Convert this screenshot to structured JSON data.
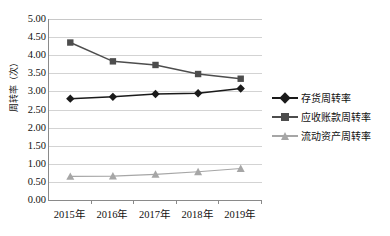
{
  "chart_data": {
    "type": "line",
    "title": "",
    "xlabel": "",
    "ylabel": "周转率（次）",
    "categories": [
      "2015年",
      "2016年",
      "2017年",
      "2018年",
      "2019年"
    ],
    "ylim": [
      0.0,
      5.0
    ],
    "ytick_step": 0.5,
    "yticks": [
      "5.00",
      "4.50",
      "4.00",
      "3.50",
      "3.00",
      "2.50",
      "2.00",
      "1.50",
      "1.00",
      "0.50",
      "0.00"
    ],
    "grid": true,
    "legend_position": "right",
    "series": [
      {
        "name": "存货周转率",
        "marker": "diamond",
        "color": "#1a1a1a",
        "values": [
          2.8,
          2.85,
          2.93,
          2.95,
          3.08
        ]
      },
      {
        "name": "应收账款周转率",
        "marker": "square",
        "color": "#4d4d4d",
        "values": [
          4.35,
          3.83,
          3.73,
          3.48,
          3.35
        ]
      },
      {
        "name": "流动资产周转率",
        "marker": "triangle",
        "color": "#a6a6a6",
        "values": [
          0.65,
          0.66,
          0.71,
          0.78,
          0.87
        ]
      }
    ]
  },
  "axis": {
    "y_title": "周转率（次）"
  },
  "legend": {
    "items": [
      {
        "label": "存货周转率"
      },
      {
        "label": "应收账款周转率"
      },
      {
        "label": "流动资产周转率"
      }
    ]
  }
}
